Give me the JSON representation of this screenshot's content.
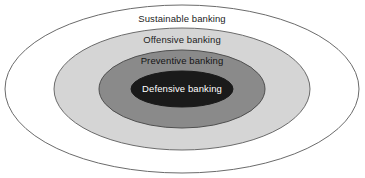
{
  "diagram": {
    "type": "concentric-ellipse-onion",
    "background_color": "#ffffff",
    "center": {
      "x": 182,
      "y": 89
    },
    "rings": [
      {
        "id": "sustainable",
        "label": "Sustainable banking",
        "fill": "#ffffff",
        "stroke": "#6b6b6b",
        "text_color": "#1c1c1c",
        "rx": 177,
        "ry": 84,
        "label_y": 19
      },
      {
        "id": "offensive",
        "label": "Offensive banking",
        "fill": "#d5d5d5",
        "stroke": "#6b6b6b",
        "text_color": "#1c1c1c",
        "rx": 128,
        "ry": 61,
        "label_y": 40
      },
      {
        "id": "preventive",
        "label": "Preventive banking",
        "fill": "#8a8a8a",
        "stroke": "#4f4f4f",
        "text_color": "#141414",
        "rx": 83,
        "ry": 39,
        "label_y": 61
      },
      {
        "id": "defensive",
        "label": "Defensive banking",
        "fill": "#1a1a1a",
        "stroke": "#1a1a1a",
        "text_color": "#ffffff",
        "rx": 51,
        "ry": 18,
        "label_y": 89
      }
    ]
  }
}
